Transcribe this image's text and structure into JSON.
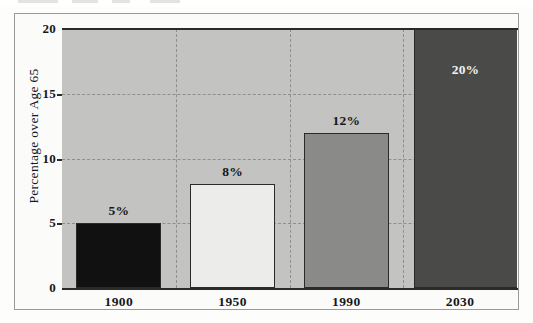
{
  "figure": {
    "frame_color": "#9a9a96",
    "paper_color": "#fdfdfc",
    "plot_background": "#c3c3c1",
    "axis_color": "#2a2a28",
    "gridline_color": "#8e8e8b"
  },
  "chart_data": {
    "type": "bar",
    "title": "",
    "subtitle": "",
    "xlabel": "",
    "ylabel": "Percentage over Age 65",
    "categories": [
      "1900",
      "1950",
      "1990",
      "2030"
    ],
    "values": [
      5,
      8,
      12,
      20
    ],
    "value_labels": [
      "5%",
      "8%",
      "12%",
      "20%"
    ],
    "ylim": [
      0,
      20
    ],
    "yticks": [
      0,
      5,
      10,
      15,
      20
    ],
    "ytick_labels": [
      "0",
      "5",
      "10",
      "15",
      "20"
    ],
    "grid": "dashed gridlines, horizontal at y ticks and vertical between categories",
    "legend": "none",
    "bar_colors": [
      "#111111",
      "#ececeb",
      "#8a8a88",
      "#4a4a48"
    ],
    "bar_label_positions": [
      "above",
      "above",
      "above",
      "inside"
    ],
    "series": [
      {
        "name": "Percentage over Age 65",
        "values": [
          5,
          8,
          12,
          20
        ]
      }
    ],
    "points": [
      {
        "category": "1900",
        "value": 5,
        "label": "5%",
        "color": "#111111",
        "label_position": "above"
      },
      {
        "category": "1950",
        "value": 8,
        "label": "8%",
        "color": "#ececeb",
        "label_position": "above"
      },
      {
        "category": "1990",
        "value": 12,
        "label": "12%",
        "color": "#8a8a88",
        "label_position": "above"
      },
      {
        "category": "2030",
        "value": 20,
        "label": "20%",
        "color": "#4a4a48",
        "label_position": "inside"
      }
    ]
  }
}
